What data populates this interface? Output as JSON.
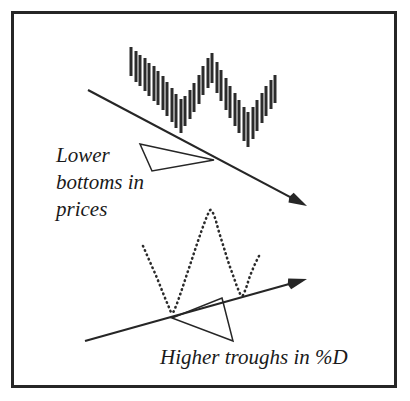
{
  "figure": {
    "background_color": "#ffffff",
    "ink_color": "#262626",
    "frame": {
      "name": "outer-border",
      "x": 11,
      "y": 11,
      "width": 386,
      "height": 377,
      "stroke_width": 3,
      "color": "#262626"
    },
    "annotations": [
      {
        "id": "lower-bottoms",
        "lines": [
          "Lower",
          "bottoms in",
          "prices"
        ],
        "x": 56,
        "y": 162,
        "line_height": 27,
        "style": "italic-serif"
      },
      {
        "id": "higher-troughs",
        "lines": [
          "Higher troughs in  %D"
        ],
        "x": 160,
        "y": 364,
        "line_height": 27,
        "style": "italic-serif"
      }
    ]
  },
  "chart_data": {
    "type": "line",
    "xlabel": "",
    "ylabel": "",
    "grid": false,
    "legend": "none",
    "panels": [
      {
        "name": "price-panel",
        "series_type": "ohlc-bars",
        "description": "Vertical price range bars forming two declining bottoms",
        "bar_width": 3,
        "bar_spacing": 4.6,
        "bars": [
          {
            "x": 131,
            "high": 47,
            "low": 76
          },
          {
            "x": 136,
            "high": 51,
            "low": 82
          },
          {
            "x": 140,
            "high": 55,
            "low": 86
          },
          {
            "x": 145,
            "high": 58,
            "low": 91
          },
          {
            "x": 149,
            "high": 63,
            "low": 96
          },
          {
            "x": 154,
            "high": 66,
            "low": 101
          },
          {
            "x": 158,
            "high": 71,
            "low": 105
          },
          {
            "x": 163,
            "high": 76,
            "low": 110
          },
          {
            "x": 167,
            "high": 82,
            "low": 116
          },
          {
            "x": 172,
            "high": 88,
            "low": 122
          },
          {
            "x": 176,
            "high": 94,
            "low": 128
          },
          {
            "x": 181,
            "high": 99,
            "low": 133
          },
          {
            "x": 185,
            "high": 96,
            "low": 126
          },
          {
            "x": 190,
            "high": 90,
            "low": 119
          },
          {
            "x": 194,
            "high": 83,
            "low": 112
          },
          {
            "x": 199,
            "high": 75,
            "low": 104
          },
          {
            "x": 203,
            "high": 66,
            "low": 95
          },
          {
            "x": 208,
            "high": 58,
            "low": 88
          },
          {
            "x": 212,
            "high": 53,
            "low": 83
          },
          {
            "x": 217,
            "high": 62,
            "low": 93
          },
          {
            "x": 221,
            "high": 70,
            "low": 101
          },
          {
            "x": 226,
            "high": 78,
            "low": 110
          },
          {
            "x": 230,
            "high": 86,
            "low": 118
          },
          {
            "x": 235,
            "high": 93,
            "low": 126
          },
          {
            "x": 239,
            "high": 100,
            "low": 133
          },
          {
            "x": 244,
            "high": 107,
            "low": 141
          },
          {
            "x": 248,
            "high": 112,
            "low": 147
          },
          {
            "x": 253,
            "high": 107,
            "low": 139
          },
          {
            "x": 257,
            "high": 100,
            "low": 131
          },
          {
            "x": 262,
            "high": 93,
            "low": 123
          },
          {
            "x": 266,
            "high": 86,
            "low": 116
          },
          {
            "x": 271,
            "high": 80,
            "low": 109
          },
          {
            "x": 275,
            "high": 75,
            "low": 103
          }
        ],
        "trendline": {
          "name": "descending-price-trendline",
          "from": {
            "x": 88,
            "y": 90
          },
          "to": {
            "x": 307,
            "y": 206
          },
          "arrow_at": "end",
          "direction": "down"
        }
      },
      {
        "name": "stochastic-panel",
        "series_type": "dotted-curve",
        "description": "Dotted %D oscillator with rising troughs",
        "line_style": "dotted",
        "points": [
          {
            "x": 143,
            "y": 246
          },
          {
            "x": 150,
            "y": 262
          },
          {
            "x": 157,
            "y": 278
          },
          {
            "x": 163,
            "y": 293
          },
          {
            "x": 168,
            "y": 305
          },
          {
            "x": 172,
            "y": 313
          },
          {
            "x": 176,
            "y": 306
          },
          {
            "x": 181,
            "y": 292
          },
          {
            "x": 187,
            "y": 274
          },
          {
            "x": 193,
            "y": 256
          },
          {
            "x": 199,
            "y": 238
          },
          {
            "x": 204,
            "y": 224
          },
          {
            "x": 208,
            "y": 214
          },
          {
            "x": 211,
            "y": 210
          },
          {
            "x": 215,
            "y": 218
          },
          {
            "x": 219,
            "y": 232
          },
          {
            "x": 224,
            "y": 248
          },
          {
            "x": 229,
            "y": 264
          },
          {
            "x": 234,
            "y": 278
          },
          {
            "x": 238,
            "y": 289
          },
          {
            "x": 242,
            "y": 296
          },
          {
            "x": 246,
            "y": 288
          },
          {
            "x": 250,
            "y": 276
          },
          {
            "x": 255,
            "y": 264
          },
          {
            "x": 259,
            "y": 256
          }
        ],
        "trendline": {
          "name": "ascending-stochastic-trendline",
          "from": {
            "x": 85,
            "y": 341
          },
          "to": {
            "x": 307,
            "y": 279
          },
          "arrow_at": "end",
          "direction": "up"
        }
      }
    ],
    "pointers": [
      {
        "name": "lower-bottoms-pointer",
        "shape": "triangle",
        "vertices": [
          {
            "x": 140,
            "y": 144
          },
          {
            "x": 214,
            "y": 160
          },
          {
            "x": 152,
            "y": 171
          }
        ]
      },
      {
        "name": "higher-troughs-pointer",
        "shape": "triangle",
        "vertices": [
          {
            "x": 222,
            "y": 298
          },
          {
            "x": 233,
            "y": 341
          },
          {
            "x": 172,
            "y": 318
          }
        ]
      }
    ]
  }
}
